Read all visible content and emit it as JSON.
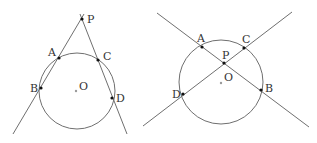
{
  "figures": [
    {
      "id": "left",
      "description": "Two secants from external point P",
      "circle": {
        "cx": 77,
        "cy": 91,
        "r": 38
      },
      "lines": [
        {
          "x1": 84,
          "y1": 14,
          "x2": 13,
          "y2": 134
        },
        {
          "x1": 80,
          "y1": 14,
          "x2": 127,
          "y2": 134
        }
      ],
      "points": [
        {
          "name": "P",
          "x": 82,
          "y": 19,
          "lx": 87,
          "ly": 23
        },
        {
          "name": "A",
          "x": 59,
          "y": 58,
          "lx": 48,
          "ly": 56
        },
        {
          "name": "C",
          "x": 98,
          "y": 60,
          "lx": 103,
          "ly": 60
        },
        {
          "name": "B",
          "x": 41,
          "y": 88,
          "lx": 29,
          "ly": 92
        },
        {
          "name": "D",
          "x": 112,
          "y": 98,
          "lx": 116,
          "ly": 102
        }
      ],
      "center": {
        "name": "O",
        "x": 76,
        "y": 91,
        "lx": 79,
        "ly": 90
      }
    },
    {
      "id": "right",
      "description": "Two chords intersecting at interior point P",
      "circle": {
        "cx": 221,
        "cy": 82,
        "r": 42
      },
      "lines": [
        {
          "x1": 157,
          "y1": 13,
          "x2": 309,
          "y2": 127
        },
        {
          "x1": 292,
          "y1": 12,
          "x2": 143,
          "y2": 126
        }
      ],
      "points": [
        {
          "name": "A",
          "x": 202,
          "y": 47,
          "lx": 197,
          "ly": 42
        },
        {
          "name": "C",
          "x": 244,
          "y": 48,
          "lx": 243,
          "ly": 43
        },
        {
          "name": "P",
          "x": 224,
          "y": 63,
          "lx": 222,
          "ly": 59
        },
        {
          "name": "D",
          "x": 183,
          "y": 94,
          "lx": 172,
          "ly": 98
        },
        {
          "name": "B",
          "x": 261,
          "y": 90,
          "lx": 265,
          "ly": 92
        }
      ],
      "center": {
        "name": "O",
        "x": 221,
        "y": 83,
        "lx": 224,
        "ly": 81
      }
    }
  ],
  "labels": {
    "left": {
      "P": "P",
      "A": "A",
      "C": "C",
      "B": "B",
      "D": "D",
      "O": "O"
    },
    "right": {
      "A": "A",
      "C": "C",
      "P": "P",
      "D": "D",
      "B": "B",
      "O": "O"
    }
  }
}
